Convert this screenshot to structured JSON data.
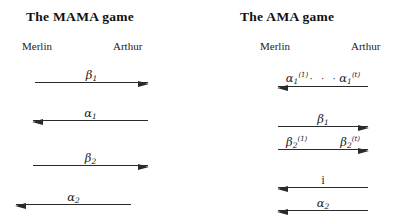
{
  "panels": [
    {
      "id": "mama",
      "title": "The  MAMA  game",
      "left_party": "Merlin",
      "right_party": "Arthur",
      "messages": [
        {
          "label": "β1",
          "symbol": "β",
          "subscript": "1",
          "direction": "right"
        },
        {
          "label": "α1",
          "symbol": "α",
          "subscript": "1",
          "direction": "left"
        },
        {
          "label": "β2",
          "symbol": "β",
          "subscript": "2",
          "direction": "right"
        },
        {
          "label": "α2",
          "symbol": "α",
          "subscript": "2",
          "direction": "left"
        }
      ]
    },
    {
      "id": "ama",
      "title": "The  AMA  game",
      "left_party": "Merlin",
      "right_party": "Arthur",
      "messages": [
        {
          "label": "α1(1) · · · α1(t)",
          "symbol": "α",
          "subscript": "1",
          "superscript_first": "(1)",
          "superscript_last": "(t)",
          "dots": "· · ·",
          "direction": "left"
        },
        {
          "label": "β1",
          "symbol": "β",
          "subscript": "1",
          "direction": "right"
        },
        {
          "label": "β2(1)   β2(t)",
          "symbol": "β",
          "subscript": "2",
          "superscript_first": "(1)",
          "superscript_last": "(t)",
          "direction": "right"
        },
        {
          "label": "i",
          "symbol": "i",
          "direction": "left"
        },
        {
          "label": "α2",
          "symbol": "α",
          "subscript": "2",
          "direction": "left"
        }
      ]
    }
  ],
  "colors": {
    "ink": "#2a2a2a",
    "background": "#ffffff"
  }
}
